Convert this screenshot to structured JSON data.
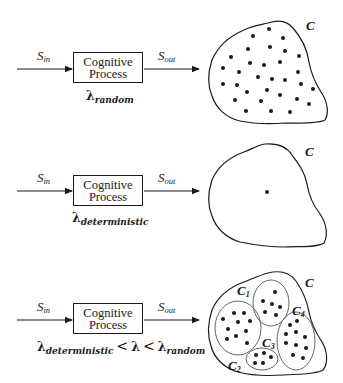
{
  "diagram": {
    "panels": [
      {
        "id": "random",
        "input_label": {
          "base": "S",
          "sub": "in"
        },
        "output_label": {
          "base": "S",
          "sub": "out"
        },
        "box": {
          "line1": "Cognitive",
          "line2": "Process"
        },
        "lambda": {
          "symbol": "λ",
          "sub": "random"
        },
        "set_label": "C",
        "description": "Many scattered points across region C"
      },
      {
        "id": "deterministic",
        "input_label": {
          "base": "S",
          "sub": "in"
        },
        "output_label": {
          "base": "S",
          "sub": "out"
        },
        "box": {
          "line1": "Cognitive",
          "line2": "Process"
        },
        "lambda": {
          "symbol": "λ",
          "sub": "deterministic"
        },
        "set_label": "C",
        "description": "Single point in region C"
      },
      {
        "id": "intermediate",
        "input_label": {
          "base": "S",
          "sub": "in"
        },
        "output_label": {
          "base": "S",
          "sub": "out"
        },
        "box": {
          "line1": "Cognitive",
          "line2": "Process"
        },
        "lambda_range": {
          "left": {
            "symbol": "λ",
            "sub": "deterministic"
          },
          "op1": "<",
          "middle": "λ",
          "op2": "<",
          "right": {
            "symbol": "λ",
            "sub": "random"
          }
        },
        "set_label": "C",
        "clusters": [
          {
            "base": "C",
            "sub": "1"
          },
          {
            "base": "C",
            "sub": "2"
          },
          {
            "base": "C",
            "sub": "3"
          },
          {
            "base": "C",
            "sub": "4"
          }
        ],
        "description": "Points grouped into four clusters within region C"
      }
    ],
    "colors": {
      "stroke": "#1a1a1a",
      "background": "#ffffff",
      "cluster_stroke": "#555555"
    }
  }
}
